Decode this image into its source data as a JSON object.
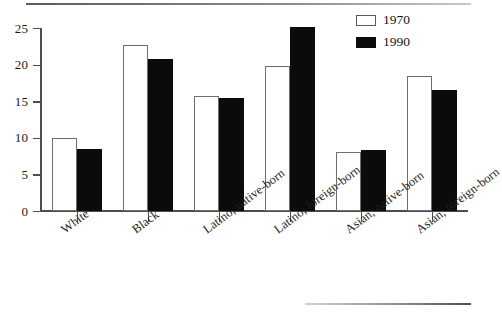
{
  "chart_data": {
    "type": "bar",
    "title": "",
    "subtitle": "",
    "xlabel": "",
    "ylabel": "",
    "ylim": [
      0,
      25
    ],
    "yticks": [
      0,
      5,
      10,
      15,
      20,
      25
    ],
    "grid": false,
    "legend_position": "top-right",
    "categories": [
      "White",
      "Black",
      "Latino, native-born",
      "Latino, foreign-born",
      "Asian, native-born",
      "Asian, foreign-born"
    ],
    "series": [
      {
        "name": "1970",
        "values": [
          10.0,
          22.7,
          15.7,
          19.8,
          8.0,
          18.5
        ]
      },
      {
        "name": "1990",
        "values": [
          8.5,
          20.8,
          15.4,
          25.2,
          8.4,
          16.5
        ]
      }
    ]
  },
  "legend": {
    "entries": [
      {
        "label": "1970",
        "swatch": "white-outlined-box"
      },
      {
        "label": "1990",
        "swatch": "black-filled-box"
      }
    ]
  },
  "colors": {
    "series_1970": "#ffffff",
    "series_1970_border": "#6e6e6e",
    "series_1990": "#0b0b0b",
    "axis": "#4d4d4d",
    "text": "#1a1a1a",
    "background": "#ffffff"
  }
}
